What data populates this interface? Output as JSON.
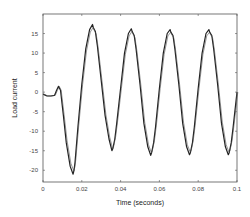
{
  "chart_data": {
    "type": "line",
    "title": "",
    "xlabel": "Time (seconds)",
    "ylabel": "Load current",
    "xlim": [
      0,
      0.1
    ],
    "ylim": [
      -23,
      20
    ],
    "grid": false,
    "legend": null,
    "x_ticks": [
      0,
      0.02,
      0.04,
      0.06,
      0.08,
      0.1
    ],
    "x_tick_labels": [
      "0",
      "0.02",
      "0.04",
      "0.06",
      "0.08",
      "0.1"
    ],
    "y_ticks": [
      15,
      10,
      5,
      0,
      -5,
      -10,
      -15,
      -20
    ],
    "y_tick_labels": [
      "15",
      "10",
      "5",
      "0",
      "-5",
      "-10",
      "-15",
      "-20"
    ],
    "series": [
      {
        "name": "Load current",
        "color": "#222222",
        "x": [
          0,
          0.002,
          0.004,
          0.006,
          0.007,
          0.008,
          0.009,
          0.0105,
          0.012,
          0.014,
          0.0155,
          0.016,
          0.0165,
          0.018,
          0.02,
          0.022,
          0.024,
          0.0255,
          0.026,
          0.027,
          0.028,
          0.03,
          0.032,
          0.034,
          0.0355,
          0.036,
          0.037,
          0.038,
          0.04,
          0.042,
          0.044,
          0.0455,
          0.046,
          0.047,
          0.048,
          0.05,
          0.052,
          0.054,
          0.0555,
          0.056,
          0.057,
          0.058,
          0.06,
          0.062,
          0.064,
          0.0655,
          0.066,
          0.067,
          0.068,
          0.07,
          0.072,
          0.074,
          0.0755,
          0.076,
          0.077,
          0.078,
          0.08,
          0.082,
          0.084,
          0.0855,
          0.086,
          0.087,
          0.088,
          0.09,
          0.092,
          0.094,
          0.0955,
          0.096,
          0.097,
          0.098,
          0.1
        ],
        "values": [
          -0.5,
          -1,
          -1,
          -0.8,
          0.5,
          1.5,
          0.5,
          -6,
          -13,
          -19,
          -21,
          -20,
          -18,
          -9,
          2,
          11,
          16,
          17.3,
          16.5,
          15.5,
          12,
          3,
          -6,
          -12,
          -15,
          -14.5,
          -12,
          -8,
          1,
          10,
          15,
          16.2,
          15.5,
          14.5,
          11,
          2,
          -8,
          -14,
          -16.2,
          -15.5,
          -13,
          -9,
          1,
          10,
          15,
          16,
          15.3,
          14.5,
          11,
          2,
          -8,
          -14,
          -16,
          -15.5,
          -13,
          -9,
          1,
          10,
          15,
          16,
          15.3,
          14.5,
          11,
          2,
          -8,
          -14,
          -16,
          -15.5,
          -13,
          -9,
          0
        ]
      }
    ]
  }
}
